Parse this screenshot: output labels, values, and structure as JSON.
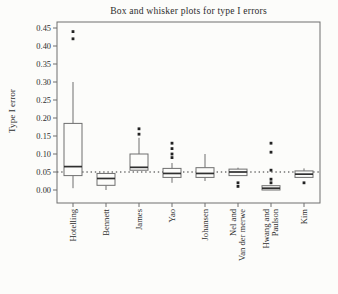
{
  "figure": {
    "title": "Box and whisker plots for type I errors",
    "ylabel": "Type I error"
  },
  "chart_data": {
    "type": "boxplot",
    "title": "Box and whisker plots for type I errors",
    "xlabel": "",
    "ylabel": "Type I error",
    "ylim": [
      0.0,
      0.45
    ],
    "ytick_step": 0.05,
    "ytick_labels": [
      "0.00",
      "0.05",
      "0.10",
      "0.15",
      "0.20",
      "0.25",
      "0.30",
      "0.35",
      "0.40",
      "0.45"
    ],
    "reference_line": 0.05,
    "reference_line_style": "dotted",
    "grid": false,
    "framed": true,
    "legend": "none",
    "categories": [
      [
        "Hotelling"
      ],
      [
        "Bennett"
      ],
      [
        "James"
      ],
      [
        "Yao"
      ],
      [
        "Johansen"
      ],
      [
        "Nel and",
        "Van der merwe"
      ],
      [
        "Hwang and",
        "Paulson"
      ],
      [
        "Kim"
      ]
    ],
    "series": [
      {
        "name": "Hotelling",
        "whisker_low": 0.005,
        "q1": 0.04,
        "median": 0.065,
        "q3": 0.185,
        "whisker_high": 0.3,
        "outliers": [
          0.42,
          0.44
        ]
      },
      {
        "name": "Bennett",
        "whisker_low": 0.0,
        "q1": 0.013,
        "median": 0.032,
        "q3": 0.046,
        "whisker_high": 0.046,
        "outliers": []
      },
      {
        "name": "James",
        "whisker_low": 0.055,
        "q1": 0.055,
        "median": 0.063,
        "q3": 0.1,
        "whisker_high": 0.145,
        "outliers": [
          0.155,
          0.17
        ]
      },
      {
        "name": "Yao",
        "whisker_low": 0.02,
        "q1": 0.035,
        "median": 0.046,
        "q3": 0.06,
        "whisker_high": 0.075,
        "outliers": [
          0.09,
          0.1,
          0.115,
          0.13
        ]
      },
      {
        "name": "Johansen",
        "whisker_low": 0.025,
        "q1": 0.035,
        "median": 0.046,
        "q3": 0.062,
        "whisker_high": 0.1,
        "outliers": []
      },
      {
        "name": "Nel and Van der merwe",
        "whisker_low": 0.04,
        "q1": 0.04,
        "median": 0.05,
        "q3": 0.058,
        "whisker_high": 0.062,
        "outliers": [
          0.01,
          0.02
        ]
      },
      {
        "name": "Hwang and Paulson",
        "whisker_low": 0.0,
        "q1": 0.0,
        "median": 0.005,
        "q3": 0.012,
        "whisker_high": 0.012,
        "outliers": [
          0.02,
          0.03,
          0.055,
          0.105,
          0.13
        ]
      },
      {
        "name": "Kim",
        "whisker_low": 0.035,
        "q1": 0.035,
        "median": 0.044,
        "q3": 0.053,
        "whisker_high": 0.06,
        "outliers": [
          0.02
        ]
      }
    ],
    "colors": {
      "background": "#fcfcfa",
      "frame": "#6e6e6e",
      "box_stroke": "#6e6e6e",
      "box_fill": "#fcfcfa",
      "median": "#2f2f2f",
      "whisker": "#6e6e6e",
      "outlier": "#222222",
      "reference": "#2f2f2f",
      "text": "#2e2e2e"
    }
  }
}
